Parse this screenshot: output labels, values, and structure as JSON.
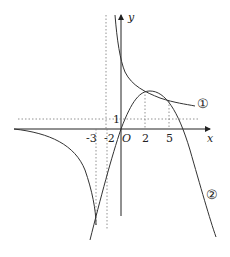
{
  "axes": {
    "x_label": "x",
    "y_label": "y",
    "origin_label": "O"
  },
  "ticks": {
    "x": [
      "-3",
      "-2",
      "2",
      "5"
    ],
    "y": [
      "1"
    ]
  },
  "curves": [
    {
      "label": "①",
      "description": "decreasing curve with vertical asymptote near x=-2"
    },
    {
      "label": "②",
      "description": "downward opening parabola-like curve through origin"
    }
  ],
  "colors": {
    "curve": "#333333",
    "axis": "#222222",
    "dotted": "#666666"
  }
}
